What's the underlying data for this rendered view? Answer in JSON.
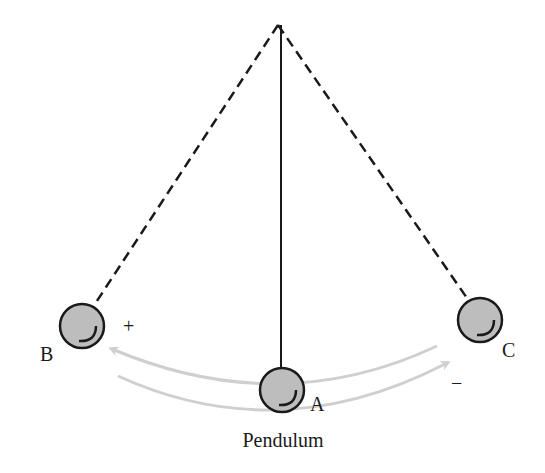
{
  "diagram": {
    "caption": "Pendulum",
    "pivot": {
      "x": 278,
      "y": 25
    },
    "positions": [
      {
        "id": "B",
        "label": "B",
        "x": 82,
        "y": 326,
        "label_x": 48,
        "label_y": 360
      },
      {
        "id": "A",
        "label": "A",
        "x": 282,
        "y": 390,
        "label_x": 312,
        "label_y": 411
      },
      {
        "id": "C",
        "label": "C",
        "x": 480,
        "y": 320,
        "label_x": 503,
        "label_y": 357
      }
    ],
    "signs": {
      "plus": {
        "text": "+",
        "x": 128,
        "y": 333
      },
      "minus": {
        "text": "−",
        "x": 457,
        "y": 388
      }
    },
    "colors": {
      "string": "#1a1a1a",
      "bob_fill": "#bdbdbd",
      "bob_stroke": "#1a1a1a",
      "arrow": "#cfcfcf"
    }
  }
}
